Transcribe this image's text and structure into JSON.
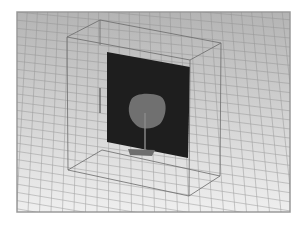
{
  "figure": {
    "type": "3d-cad-render",
    "colors": {
      "page_bg": "#ffffff",
      "viewport_top": "#b4b4b4",
      "viewport_bottom": "#efefef",
      "viewport_border": "#9a9a9a",
      "grid_line": "#8e8e8e",
      "box_edge": "#6a6a6a",
      "substrate": "#1e1e1e",
      "patch": "#707070",
      "feed_line": "#8a8a8a",
      "ground_strip": "#6e6e6e"
    }
  },
  "viewport": {
    "x": 17,
    "y": 12,
    "width": 273,
    "height": 200
  },
  "boundary_box": {
    "top_back_left": [
      100,
      20
    ],
    "top_front_left": [
      67,
      37
    ],
    "top_front_right": [
      190,
      60
    ],
    "top_back_right": [
      221,
      43
    ],
    "bottom_back_left": [
      102,
      150
    ],
    "bottom_front_left": [
      68,
      170
    ],
    "bottom_front_right": [
      189,
      196
    ],
    "bottom_back_right": [
      220,
      176
    ]
  },
  "substrate": {
    "points": [
      [
        107,
        52
      ],
      [
        190,
        67
      ],
      [
        188,
        158
      ],
      [
        107,
        142
      ]
    ]
  },
  "patch": {
    "cx": 147,
    "cy": 110,
    "rx": 20,
    "ry": 17
  },
  "feed_line": {
    "x": 145,
    "y1": 113,
    "y2": 155
  },
  "ground_strip": {
    "points": [
      [
        128,
        149
      ],
      [
        155,
        150
      ],
      [
        152,
        156
      ],
      [
        130,
        155
      ]
    ]
  },
  "hidden_edge": {
    "x": 100,
    "y1": 88,
    "y2": 113
  }
}
